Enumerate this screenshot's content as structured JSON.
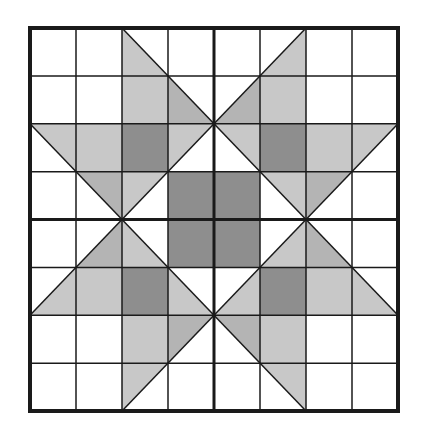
{
  "figure": {
    "type": "quilt-block-grid",
    "grid": {
      "cols": 8,
      "rows": 8,
      "major_every": 4
    },
    "bounds": {
      "x0": 30,
      "y0": 28,
      "x1": 398,
      "y1": 411
    },
    "colors": {
      "background": "#ffffff",
      "dark": "#8e8e8e",
      "medium": "#b4b4b4",
      "pale": "#c8c8c8",
      "line": "#1a1a1a"
    },
    "stroke": {
      "minor": 1.5,
      "major": 3,
      "outer": 4,
      "diagonal": 1.5
    },
    "dark_cells": [
      [
        2,
        2
      ],
      [
        5,
        2
      ],
      [
        3,
        3
      ],
      [
        4,
        3
      ],
      [
        3,
        4
      ],
      [
        4,
        4
      ],
      [
        2,
        5
      ],
      [
        5,
        5
      ]
    ],
    "quadrant_top_left_shapes": [
      {
        "fill": "pale",
        "points": [
          [
            2,
            0
          ],
          [
            3,
            1
          ],
          [
            3,
            2
          ],
          [
            2,
            2
          ]
        ]
      },
      {
        "fill": "medium",
        "points": [
          [
            3,
            1
          ],
          [
            4,
            2
          ],
          [
            3,
            2
          ]
        ]
      },
      {
        "fill": "pale",
        "points": [
          [
            0,
            2
          ],
          [
            2,
            2
          ],
          [
            2,
            3
          ],
          [
            1,
            3
          ]
        ]
      },
      {
        "fill": "medium",
        "points": [
          [
            1,
            3
          ],
          [
            2,
            3
          ],
          [
            2,
            4
          ]
        ]
      },
      {
        "fill": "pale",
        "points": [
          [
            3,
            2
          ],
          [
            4,
            2
          ],
          [
            3,
            3
          ]
        ]
      },
      {
        "fill": "pale",
        "points": [
          [
            2,
            3
          ],
          [
            3,
            3
          ],
          [
            2,
            4
          ]
        ]
      }
    ],
    "diagonals_top_left": [
      [
        [
          2,
          0
        ],
        [
          4,
          2
        ]
      ],
      [
        [
          0,
          2
        ],
        [
          2,
          4
        ]
      ],
      [
        [
          4,
          2
        ],
        [
          2,
          4
        ]
      ]
    ]
  }
}
